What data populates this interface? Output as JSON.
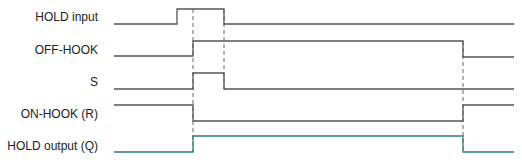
{
  "diagram": {
    "type": "timing-diagram",
    "signals": [
      {
        "label": "HOLD input",
        "label_y": 10,
        "color": "#555555",
        "points": "114,24 177,24 177,9 224,9 224,24 514,24"
      },
      {
        "label": "OFF-HOOK",
        "label_y": 43,
        "color": "#555555",
        "points": "114,56 193,56 193,41 463,41 463,57 514,57"
      },
      {
        "label": "S",
        "label_y": 75,
        "color": "#555555",
        "points": "114,89 193,89 193,73 224,73 224,89 514,89"
      },
      {
        "label": "ON-HOOK (R)",
        "label_y": 107,
        "color": "#555555",
        "points": "114,105 193,105 193,121 463,121 463,105 514,105"
      },
      {
        "label": "HOLD output (Q)",
        "label_y": 139,
        "color": "#2e7d7a",
        "points": "114,152 193,152 193,136 463,136 463,152 514,152"
      }
    ],
    "dashed_markers": [
      {
        "x": 193,
        "y1": 9,
        "y2": 152
      },
      {
        "x": 224,
        "y1": 9,
        "y2": 89
      },
      {
        "x": 463,
        "y1": 41,
        "y2": 152
      }
    ]
  }
}
